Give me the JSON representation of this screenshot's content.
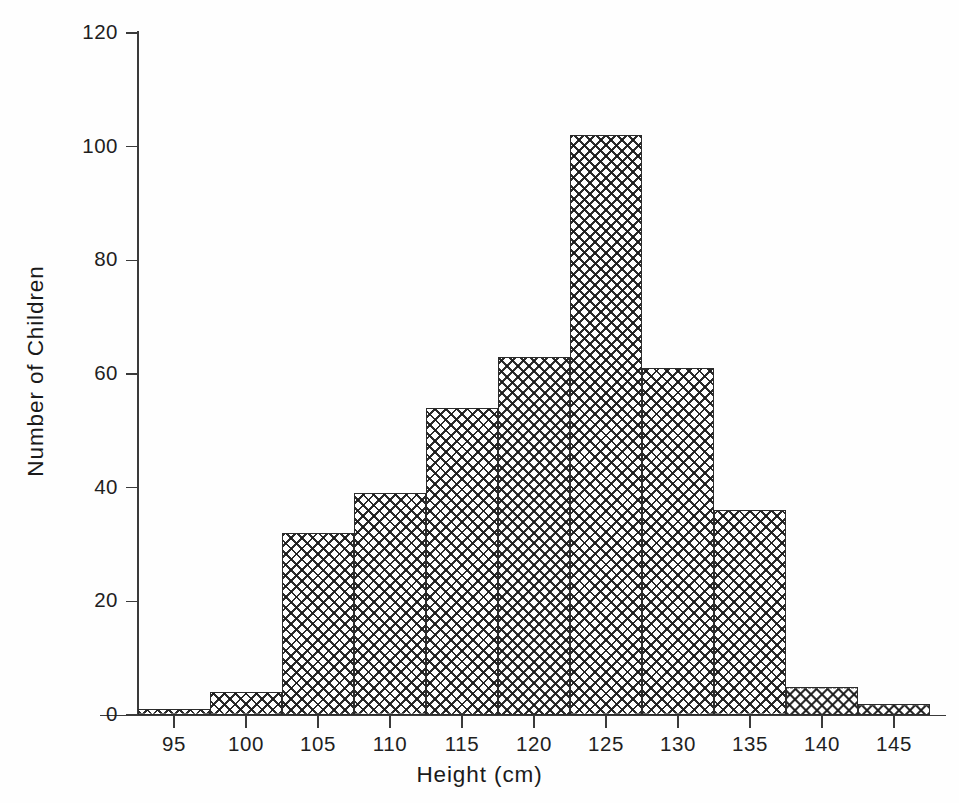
{
  "chart_data": {
    "type": "bar",
    "title": "",
    "xlabel": "Height (cm)",
    "ylabel": "Number of Children",
    "grid": false,
    "legend": null,
    "bin_width": 5,
    "bin_edges": [
      92.5,
      97.5,
      102.5,
      107.5,
      112.5,
      117.5,
      122.5,
      127.5,
      132.5,
      137.5,
      142.5,
      147.5
    ],
    "categories": [
      "92.5-97.5",
      "97.5-102.5",
      "102.5-107.5",
      "107.5-112.5",
      "112.5-117.5",
      "117.5-122.5",
      "122.5-127.5",
      "127.5-132.5",
      "132.5-137.5",
      "137.5-142.5",
      "142.5-147.5"
    ],
    "values": [
      1,
      4,
      32,
      39,
      54,
      63,
      102,
      61,
      36,
      5,
      2
    ],
    "xlim": [
      92.5,
      147.5
    ],
    "ylim": [
      0,
      120
    ],
    "xticks": [
      95,
      100,
      105,
      110,
      115,
      120,
      125,
      130,
      135,
      140,
      145
    ],
    "xtick_labels": [
      "95",
      "100",
      "105",
      "110",
      "115",
      "120",
      "125",
      "130",
      "135",
      "140",
      "145"
    ],
    "yticks": [
      0,
      20,
      40,
      60,
      80,
      100,
      120
    ],
    "ytick_labels": [
      "0",
      "20",
      "40",
      "60",
      "80",
      "100",
      "120"
    ],
    "bar_fill": "crosshatch",
    "bar_edge_color": "#2b2b2b",
    "axis_color": "#3a3a3a"
  }
}
